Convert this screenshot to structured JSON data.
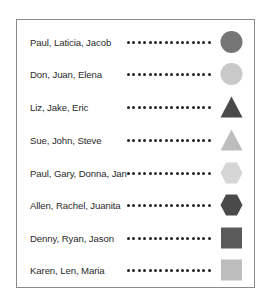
{
  "legend": {
    "rows": [
      {
        "label": "Paul, Laticia, Jacob",
        "shape": "circle",
        "shape_icon": "circle-icon",
        "color": "#767676"
      },
      {
        "label": "Don, Juan, Elena",
        "shape": "circle",
        "shape_icon": "circle-icon",
        "color": "#c9c9c9"
      },
      {
        "label": "Liz, Jake, Eric",
        "shape": "triangle",
        "shape_icon": "triangle-icon",
        "color": "#4a4a4a"
      },
      {
        "label": "Sue, John, Steve",
        "shape": "triangle",
        "shape_icon": "triangle-icon",
        "color": "#bdbdbd"
      },
      {
        "label": "Paul, Gary, Donna, Jan",
        "shape": "hexagon",
        "shape_icon": "hexagon-icon",
        "color": "#d6d6d6"
      },
      {
        "label": "Allen, Rachel, Juanita",
        "shape": "hexagon",
        "shape_icon": "hexagon-icon",
        "color": "#4a4a4a"
      },
      {
        "label": "Denny, Ryan, Jason",
        "shape": "square",
        "shape_icon": "square-icon",
        "color": "#5a5a5a"
      },
      {
        "label": "Karen, Len, Maria",
        "shape": "square",
        "shape_icon": "square-icon",
        "color": "#bdbdbd"
      }
    ],
    "dots_per_row": 16
  }
}
